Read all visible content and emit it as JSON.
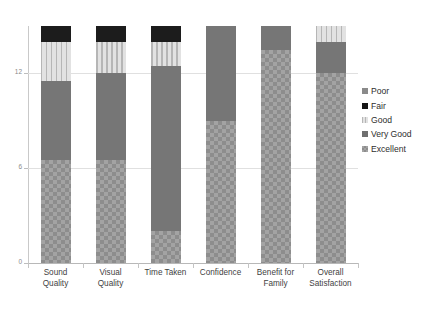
{
  "chart_data": {
    "type": "bar",
    "subtype": "stacked-column",
    "title": "",
    "xlabel": "",
    "ylabel": "",
    "ylim": [
      0,
      15
    ],
    "yticks": [
      0,
      6,
      12
    ],
    "ytick_labels": [
      "0",
      "6",
      "12"
    ],
    "grid": true,
    "legend_position": "right",
    "categories": [
      "Sound Quality",
      "Visual Quality",
      "Time Taken",
      "Confidence",
      "Benefit for Family",
      "Overall Satisfaction"
    ],
    "category_lines": [
      [
        "Sound",
        "Quality"
      ],
      [
        "Visual",
        "Quality"
      ],
      [
        "Time Taken"
      ],
      [
        "Confidence"
      ],
      [
        "Benefit for",
        "Family"
      ],
      [
        "Overall",
        "Satisfaction"
      ]
    ],
    "series": [
      {
        "name": "Excellent",
        "key": "excellent",
        "color": "#a3a3a3",
        "pattern": "checkered",
        "values": [
          6.5,
          6.5,
          2.0,
          9.0,
          13.5,
          12.0
        ]
      },
      {
        "name": "Very Good",
        "key": "verygood",
        "color": "#767676",
        "pattern": "solid",
        "values": [
          5.0,
          5.5,
          10.5,
          6.0,
          1.5,
          2.0
        ]
      },
      {
        "name": "Good",
        "key": "good",
        "color": "#d3d3d3",
        "pattern": "vertical-stripes",
        "values": [
          2.5,
          2.0,
          1.5,
          0,
          0,
          1.0
        ]
      },
      {
        "name": "Fair",
        "key": "fair",
        "color": "#1c1c1c",
        "pattern": "solid",
        "values": [
          1.0,
          1.0,
          1.0,
          0,
          0,
          0
        ]
      },
      {
        "name": "Poor",
        "key": "poor",
        "color": "#8f8f8f",
        "pattern": "solid",
        "values": [
          0,
          0,
          0,
          0,
          0,
          0
        ]
      }
    ],
    "stack_order_bottom_to_top": [
      "Excellent",
      "Very Good",
      "Good",
      "Fair",
      "Poor"
    ],
    "totals": [
      15,
      15,
      15,
      15,
      15,
      15
    ]
  },
  "legend": {
    "entries": [
      {
        "label": "Poor",
        "key": "poor"
      },
      {
        "label": "Fair",
        "key": "fair"
      },
      {
        "label": "Good",
        "key": "good"
      },
      {
        "label": "Very Good",
        "key": "verygood"
      },
      {
        "label": "Excellent",
        "key": "excellent"
      }
    ]
  },
  "colors": {
    "excellent": "#a3a3a3",
    "very_good": "#767676",
    "good": "#d3d3d3",
    "fair": "#1c1c1c",
    "poor": "#8f8f8f",
    "gridline": "#e0e0e0",
    "axis": "#c0c0c0",
    "background": "#ffffff",
    "text": "#3a3a3a"
  }
}
